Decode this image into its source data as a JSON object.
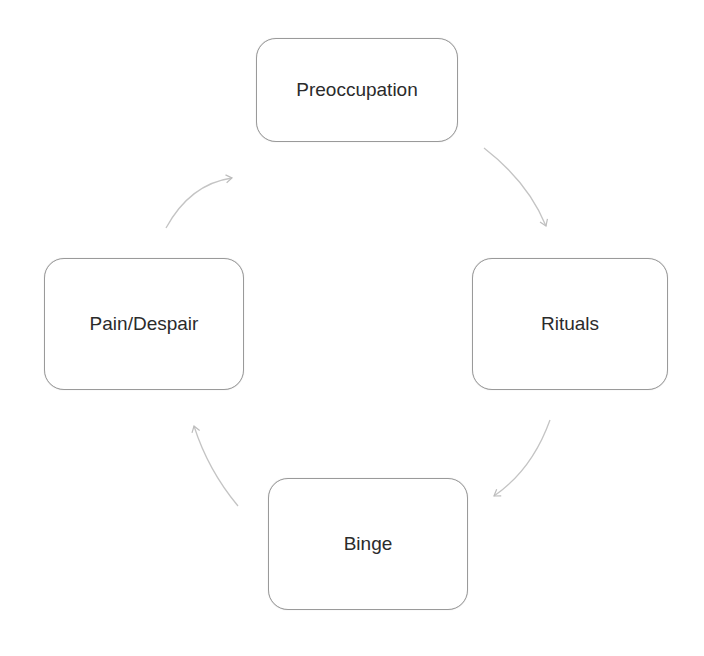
{
  "diagram": {
    "type": "cycle",
    "nodes": [
      {
        "id": "preoccupation",
        "label": "Preoccupation",
        "x": 256,
        "y": 38,
        "w": 202,
        "h": 104
      },
      {
        "id": "rituals",
        "label": "Rituals",
        "x": 472,
        "y": 258,
        "w": 196,
        "h": 132
      },
      {
        "id": "binge",
        "label": "Binge",
        "x": 268,
        "y": 478,
        "w": 200,
        "h": 132
      },
      {
        "id": "pain-despair",
        "label": "Pain/Despair",
        "x": 44,
        "y": 258,
        "w": 200,
        "h": 132
      }
    ],
    "edges": [
      {
        "from": "preoccupation",
        "to": "rituals"
      },
      {
        "from": "rituals",
        "to": "binge"
      },
      {
        "from": "binge",
        "to": "pain-despair"
      },
      {
        "from": "pain-despair",
        "to": "preoccupation"
      }
    ],
    "colors": {
      "border": "#9a9a9a",
      "arrow": "#c4c4c4",
      "text": "#2b2b2b",
      "background": "#ffffff"
    }
  }
}
